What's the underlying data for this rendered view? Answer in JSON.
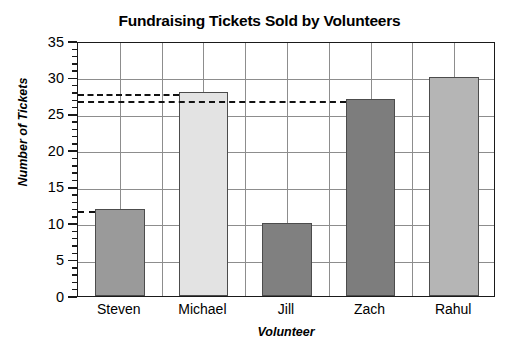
{
  "chart_data": {
    "type": "bar",
    "title": "Fundraising Tickets Sold by Volunteers",
    "xlabel": "Volunteer",
    "ylabel": "Number of Tickets",
    "categories": [
      "Steven",
      "Michael",
      "Jill",
      "Zach",
      "Rahul"
    ],
    "values": [
      12,
      28,
      10,
      27,
      30
    ],
    "bar_colors": [
      "#9a9a9a",
      "#e3e3e3",
      "#808080",
      "#7d7d7d",
      "#b5b5b5"
    ],
    "bar_edge_color": "#4c4c4c",
    "ylim": [
      0,
      35
    ],
    "yticks": [
      0,
      5,
      10,
      15,
      20,
      25,
      30,
      35
    ],
    "ytick_labels": [
      "0",
      "5",
      "10",
      "15",
      "20",
      "25",
      "30",
      "35"
    ],
    "y_minor_tick_step": 1,
    "grid": "both",
    "grid_color": "#8d8d8d",
    "legend": "none",
    "axis_color": "#1a1a1a",
    "background": "#ffffff",
    "annotations": [
      {
        "name": "dashed-line-28",
        "value": 28,
        "from_category": null,
        "to_category": "Michael",
        "style": "dashed"
      },
      {
        "name": "dashed-line-27",
        "value": 27,
        "from_category": null,
        "to_category": "Zach",
        "style": "dashed"
      },
      {
        "name": "dashed-line-12",
        "value": 12,
        "from_category": null,
        "to_category": "Steven",
        "style": "dashed"
      }
    ],
    "annotation_color": "#111111",
    "x_vertical_gridline_count": 9
  }
}
